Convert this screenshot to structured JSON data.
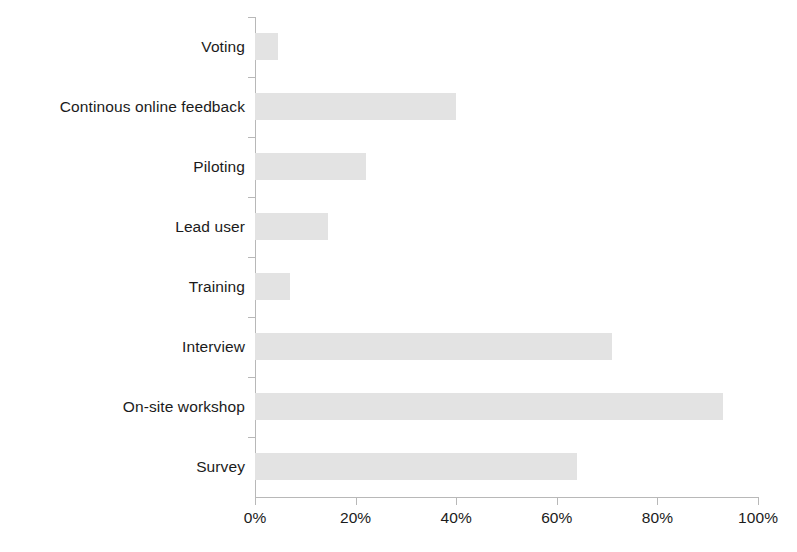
{
  "chart_data": {
    "type": "bar",
    "orientation": "horizontal",
    "title": "",
    "subtitle": "",
    "xlabel": "",
    "ylabel": "",
    "xlim": [
      0,
      100
    ],
    "xtick_labels": [
      "0%",
      "20%",
      "40%",
      "60%",
      "80%",
      "100%"
    ],
    "xticks": [
      0,
      20,
      40,
      60,
      80,
      100
    ],
    "grid": false,
    "legend": null,
    "bar_color": "#e3e3e3",
    "axis_color": "#b8b8b8",
    "text_color": "#1b1b1b",
    "background": "#ffffff",
    "value_unit": "%",
    "categories": [
      "Voting",
      "Continous online feedback",
      "Piloting",
      "Lead user",
      "Training",
      "Interview",
      "On-site workshop",
      "Survey"
    ],
    "values": [
      4.5,
      40,
      22,
      14.5,
      7,
      71,
      93,
      64
    ],
    "series": [
      {
        "name": "",
        "values": [
          4.5,
          40,
          22,
          14.5,
          7,
          71,
          93,
          64
        ]
      }
    ],
    "points": [
      {
        "category": "Voting",
        "value": 4.5
      },
      {
        "category": "Continous online feedback",
        "value": 40
      },
      {
        "category": "Piloting",
        "value": 22
      },
      {
        "category": "Lead user",
        "value": 14.5
      },
      {
        "category": "Training",
        "value": 7
      },
      {
        "category": "Interview",
        "value": 71
      },
      {
        "category": "On-site workshop",
        "value": 93
      },
      {
        "category": "Survey",
        "value": 64
      }
    ]
  }
}
